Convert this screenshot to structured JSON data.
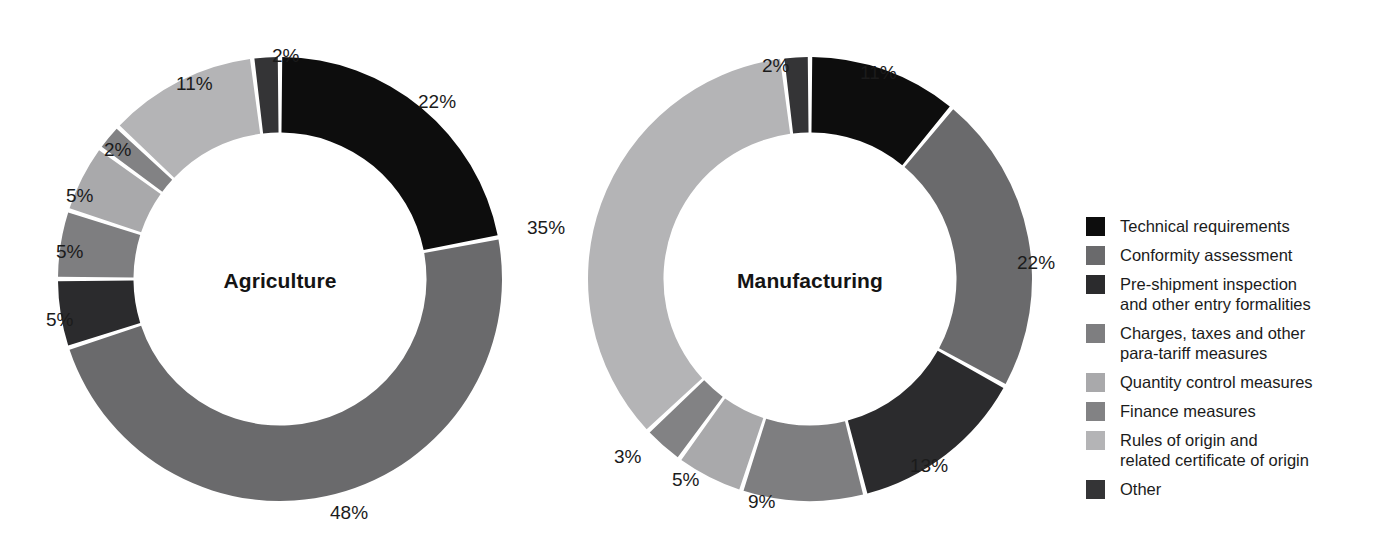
{
  "figure": {
    "background": "#ffffff",
    "label_suffix": "%"
  },
  "legend": {
    "position": "right",
    "items": [
      {
        "label_line1": "Technical requirements",
        "label_line2": "",
        "color": "#0d0d0d"
      },
      {
        "label_line1": "Conformity assessment",
        "label_line2": "",
        "color": "#6a6a6c"
      },
      {
        "label_line1": "Pre-shipment inspection",
        "label_line2": "and other entry formalities",
        "color": "#2b2b2d"
      },
      {
        "label_line1": "Charges, taxes and other",
        "label_line2": "para-tariff measures",
        "color": "#7e7e80"
      },
      {
        "label_line1": "Quantity control measures",
        "label_line2": "",
        "color": "#a9a9ab"
      },
      {
        "label_line1": "Finance measures",
        "label_line2": "",
        "color": "#828284"
      },
      {
        "label_line1": "Rules of origin and",
        "label_line2": "related certificate of origin",
        "color": "#b4b4b6"
      },
      {
        "label_line1": "Other",
        "label_line2": "",
        "color": "#343436"
      }
    ]
  },
  "chart_data": [
    {
      "type": "pie",
      "title": "Agriculture",
      "donut": true,
      "hole_ratio": 0.66,
      "start_angle_deg": 0,
      "direction": "clockwise",
      "unit": "%",
      "categories": [
        "Technical requirements",
        "Conformity assessment",
        "Pre-shipment inspection and other entry formalities",
        "Charges, taxes and other para-tariff measures",
        "Quantity control measures",
        "Finance measures",
        "Rules of origin and related certificate of origin",
        "Other"
      ],
      "values": [
        22,
        48,
        5,
        5,
        5,
        2,
        11,
        2
      ],
      "labels": [
        "22%",
        "48%",
        "5%",
        "5%",
        "5%",
        "2%",
        "11%",
        "2%"
      ],
      "colors": [
        "#0d0d0d",
        "#6a6a6c",
        "#2b2b2d",
        "#7e7e80",
        "#a9a9ab",
        "#828284",
        "#b4b4b6",
        "#343436"
      ]
    },
    {
      "type": "pie",
      "title": "Manufacturing",
      "donut": true,
      "hole_ratio": 0.66,
      "start_angle_deg": 0,
      "direction": "clockwise",
      "unit": "%",
      "categories": [
        "Technical requirements",
        "Conformity assessment",
        "Pre-shipment inspection and other entry formalities",
        "Charges, taxes and other para-tariff measures",
        "Quantity control measures",
        "Finance measures",
        "Rules of origin and related certificate of origin",
        "Other"
      ],
      "values": [
        11,
        22,
        13,
        9,
        5,
        3,
        35,
        2
      ],
      "labels": [
        "11%",
        "22%",
        "13%",
        "9%",
        "5%",
        "3%",
        "35%",
        "2%"
      ],
      "colors": [
        "#0d0d0d",
        "#6a6a6c",
        "#2b2b2d",
        "#7e7e80",
        "#a9a9ab",
        "#828284",
        "#b4b4b6",
        "#343436"
      ]
    }
  ],
  "callouts": {
    "agriculture": [
      {
        "text": "2%",
        "x": 272,
        "y": 46
      },
      {
        "text": "22%",
        "x": 418,
        "y": 92
      },
      {
        "text": "48%",
        "x": 330,
        "y": 503
      },
      {
        "text": "5%",
        "x": 46,
        "y": 310
      },
      {
        "text": "5%",
        "x": 56,
        "y": 242
      },
      {
        "text": "5%",
        "x": 66,
        "y": 186
      },
      {
        "text": "2%",
        "x": 104,
        "y": 140
      },
      {
        "text": "11%",
        "x": 176,
        "y": 74
      }
    ],
    "manufacturing": [
      {
        "text": "2%",
        "x": 762,
        "y": 56
      },
      {
        "text": "11%",
        "x": 860,
        "y": 63
      },
      {
        "text": "22%",
        "x": 1017,
        "y": 253
      },
      {
        "text": "13%",
        "x": 910,
        "y": 456
      },
      {
        "text": "9%",
        "x": 748,
        "y": 492
      },
      {
        "text": "5%",
        "x": 672,
        "y": 470
      },
      {
        "text": "3%",
        "x": 614,
        "y": 447
      },
      {
        "text": "35%",
        "x": 527,
        "y": 218
      }
    ]
  }
}
